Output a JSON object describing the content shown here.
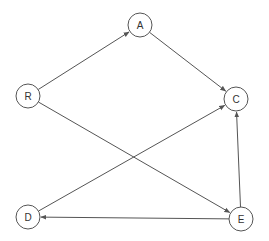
{
  "diagram": {
    "type": "directed-graph",
    "colors": {
      "node_stroke": "#555555",
      "node_fill": "#ffffff",
      "edge": "#555555",
      "label": "#333333"
    },
    "node_radius": 12,
    "nodes": [
      {
        "id": "R",
        "label": "R",
        "x": 28,
        "y": 96
      },
      {
        "id": "A",
        "label": "A",
        "x": 140,
        "y": 25
      },
      {
        "id": "C",
        "label": "C",
        "x": 236,
        "y": 99
      },
      {
        "id": "D",
        "label": "D",
        "x": 28,
        "y": 217
      },
      {
        "id": "E",
        "label": "E",
        "x": 241,
        "y": 219
      }
    ],
    "edges": [
      {
        "from": "R",
        "to": "A"
      },
      {
        "from": "A",
        "to": "C"
      },
      {
        "from": "R",
        "to": "E"
      },
      {
        "from": "D",
        "to": "C"
      },
      {
        "from": "E",
        "to": "C"
      },
      {
        "from": "E",
        "to": "D"
      }
    ]
  }
}
